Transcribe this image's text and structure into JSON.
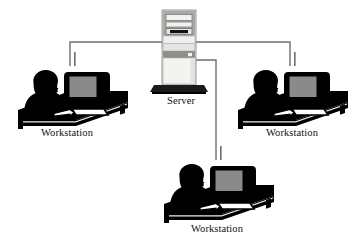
{
  "diagram": {
    "type": "network-topology",
    "topology": "star",
    "canvas": {
      "width": 362,
      "height": 239,
      "background": "#ffffff"
    },
    "nodes": [
      {
        "id": "server",
        "kind": "server-tower",
        "label": "Server",
        "label_x": 181,
        "label_y": 104,
        "x": 162,
        "y": 10,
        "width": 34,
        "height": 75
      },
      {
        "id": "workstation-left",
        "kind": "workstation",
        "label": "Workstation",
        "label_x": 67,
        "label_y": 136,
        "x": 12,
        "y": 58,
        "width": 118,
        "height": 68
      },
      {
        "id": "workstation-right",
        "kind": "workstation",
        "label": "Workstation",
        "label_x": 292,
        "label_y": 136,
        "x": 232,
        "y": 58,
        "width": 118,
        "height": 68
      },
      {
        "id": "workstation-bottom",
        "kind": "workstation",
        "label": "Workstation",
        "label_x": 217,
        "label_y": 232,
        "x": 158,
        "y": 152,
        "width": 118,
        "height": 68
      }
    ],
    "cables": [
      {
        "id": "cable-server-to-left",
        "from": "server",
        "to": "workstation-left",
        "color": "#6e6e6e"
      },
      {
        "id": "cable-server-to-right",
        "from": "server",
        "to": "workstation-right",
        "color": "#6e6e6e"
      },
      {
        "id": "cable-server-to-bottom",
        "from": "server",
        "to": "workstation-bottom",
        "color": "#6e6e6e"
      }
    ],
    "colors": {
      "silhouette": "#000000",
      "screen_gray": "#8a8a8a",
      "cable": "#6e6e6e",
      "server_body": "#d7d7d5",
      "server_bay_dark": "#8e8e8c",
      "server_panel_light": "#efefed",
      "label_text": "#111111",
      "background": "#ffffff"
    }
  }
}
